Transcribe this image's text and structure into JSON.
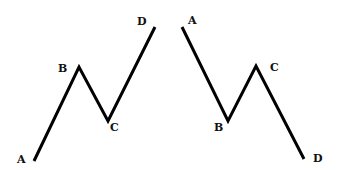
{
  "diagram": {
    "type": "abcd-pattern",
    "line_color": "#000000",
    "background": "#ffffff",
    "patterns": [
      {
        "name": "bullish",
        "points": [
          {
            "label": "A",
            "x": 34,
            "y": 161,
            "lx": 17,
            "ly": 163
          },
          {
            "label": "B",
            "x": 79,
            "y": 67,
            "lx": 58,
            "ly": 72
          },
          {
            "label": "C",
            "x": 108,
            "y": 121,
            "lx": 110,
            "ly": 131
          },
          {
            "label": "D",
            "x": 155,
            "y": 27,
            "lx": 137,
            "ly": 25
          }
        ]
      },
      {
        "name": "bearish",
        "points": [
          {
            "label": "A",
            "x": 182,
            "y": 27,
            "lx": 188,
            "ly": 24
          },
          {
            "label": "B",
            "x": 228,
            "y": 121,
            "lx": 214,
            "ly": 131
          },
          {
            "label": "C",
            "x": 256,
            "y": 66,
            "lx": 270,
            "ly": 71
          },
          {
            "label": "D",
            "x": 304,
            "y": 159,
            "lx": 313,
            "ly": 162
          }
        ]
      }
    ]
  }
}
